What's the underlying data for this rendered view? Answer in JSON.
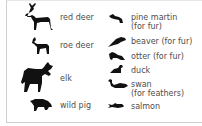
{
  "legend": {
    "left_column": [
      {
        "icon": "red-deer-icon",
        "label": "red deer"
      },
      {
        "icon": "roe-deer-icon",
        "label": "roe deer"
      },
      {
        "icon": "elk-icon",
        "label": "elk"
      },
      {
        "icon": "wild-pig-icon",
        "label": "wild pig"
      }
    ],
    "right_column": [
      {
        "icon": "pine-martin-icon",
        "label": "pine martin",
        "sub": "(for fur)"
      },
      {
        "icon": "beaver-icon",
        "label": "beaver (for fur)"
      },
      {
        "icon": "otter-icon",
        "label": "otter (for fur)"
      },
      {
        "icon": "duck-icon",
        "label": "duck"
      },
      {
        "icon": "swan-icon",
        "label": "swan",
        "sub": "(for feathers)"
      },
      {
        "icon": "salmon-icon",
        "label": "salmon"
      }
    ]
  },
  "colors": {
    "icon": "#111111",
    "text": "#4d4d4d",
    "border": "#cfcfcf"
  }
}
